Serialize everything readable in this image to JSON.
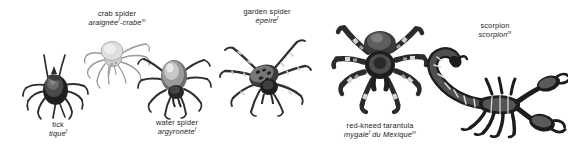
{
  "plate": {
    "background_color": "#ffffff",
    "text_color": "#1c1c1c",
    "ink_dark": "#2b2b2b",
    "ink_mid": "#6f6f6f",
    "ink_light": "#b8b8b8"
  },
  "specimens": [
    {
      "id": "tick",
      "english_name": "tick",
      "french_name": "tique",
      "french_gender": "f",
      "caption_position": "below"
    },
    {
      "id": "crab-spider",
      "english_name": "crab spider",
      "french_name_part1": "araignée",
      "french_gender1": "f",
      "french_separator": "-crabe",
      "french_gender2": "m",
      "caption_position": "above"
    },
    {
      "id": "water-spider",
      "english_name": "water spider",
      "french_name": "argyronète",
      "french_gender": "f",
      "caption_position": "below"
    },
    {
      "id": "garden-spider",
      "english_name": "garden spider",
      "french_name": "épeire",
      "french_gender": "f",
      "caption_position": "above"
    },
    {
      "id": "red-kneed-tarantula",
      "english_name": "red-kneed tarantula",
      "french_name_part1": "mygale",
      "french_gender1": "f",
      "french_separator": " du Mexique",
      "french_gender2": "m",
      "caption_position": "below"
    },
    {
      "id": "scorpion",
      "english_name": "scorpion",
      "french_name": "scorpion",
      "french_gender": "m",
      "caption_position": "above"
    }
  ]
}
